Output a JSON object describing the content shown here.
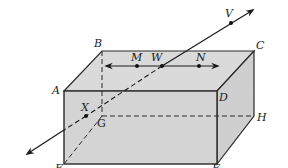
{
  "diagram": {
    "type": "rectangular-prism-with-lines",
    "colors": {
      "face_fill": "#d6d6d6",
      "face_fill_top": "#dadada",
      "face_fill_side": "#d0d0d0",
      "edge": "#2a2a2a",
      "background": "#ffffff"
    },
    "vertices": {
      "A": {
        "label": "A",
        "x": 64,
        "y": 91
      },
      "B": {
        "label": "B",
        "x": 102,
        "y": 51
      },
      "C": {
        "label": "C",
        "x": 254,
        "y": 51
      },
      "D": {
        "label": "D",
        "x": 217,
        "y": 91
      },
      "E": {
        "label": "E",
        "x": 64,
        "y": 164
      },
      "F": {
        "label": "F",
        "x": 217,
        "y": 164
      },
      "G": {
        "label": "G",
        "x": 102,
        "y": 116
      },
      "H": {
        "label": "H",
        "x": 254,
        "y": 116
      }
    },
    "points": {
      "M": {
        "label": "M",
        "x": 137,
        "y": 66
      },
      "W": {
        "label": "W",
        "x": 162,
        "y": 66
      },
      "N": {
        "label": "N",
        "x": 199,
        "y": 66
      },
      "V": {
        "label": "V",
        "x": 231,
        "y": 23
      },
      "X": {
        "label": "X",
        "x": 86,
        "y": 116
      }
    },
    "lines": [
      {
        "name": "line-MN",
        "through": [
          "M",
          "W",
          "N"
        ],
        "arrows": "both"
      },
      {
        "name": "line-VX",
        "through": [
          "V",
          "W",
          "X"
        ],
        "arrows": "both"
      }
    ]
  }
}
